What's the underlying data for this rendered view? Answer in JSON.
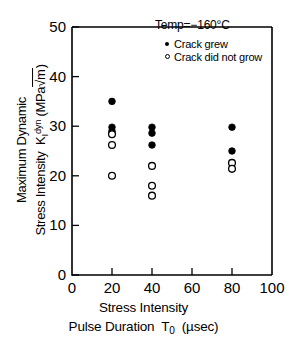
{
  "chart_data": {
    "type": "scatter",
    "title": "",
    "xlabel": "Stress Intensity Pulse Duration T0 (µsec)",
    "ylabel": "Maximum Dynamic Stress Intensity KIdyn (MPa√m)",
    "xlim": [
      0,
      100
    ],
    "ylim": [
      0,
      50
    ],
    "xticks": [
      0,
      20,
      40,
      60,
      80,
      100
    ],
    "yticks": [
      0,
      10,
      20,
      30,
      40,
      50
    ],
    "grid": false,
    "legend_position": "top-right",
    "annotation": "Temp=−160°C",
    "series": [
      {
        "name": "Crack grew",
        "marker": "filled-circle",
        "color": "#000000",
        "points": [
          {
            "x": 20,
            "y": 35.0
          },
          {
            "x": 20,
            "y": 29.8
          },
          {
            "x": 20,
            "y": 29.0
          },
          {
            "x": 40,
            "y": 29.8
          },
          {
            "x": 40,
            "y": 28.6
          },
          {
            "x": 40,
            "y": 26.2
          },
          {
            "x": 80,
            "y": 29.8
          },
          {
            "x": 80,
            "y": 25.0
          }
        ]
      },
      {
        "name": "Crack did not grow",
        "marker": "open-circle",
        "color": "#000000",
        "points": [
          {
            "x": 20,
            "y": 28.4
          },
          {
            "x": 20,
            "y": 26.2
          },
          {
            "x": 20,
            "y": 20.0
          },
          {
            "x": 40,
            "y": 22.0
          },
          {
            "x": 40,
            "y": 18.0
          },
          {
            "x": 40,
            "y": 16.0
          },
          {
            "x": 80,
            "y": 22.6
          },
          {
            "x": 80,
            "y": 21.4
          }
        ]
      }
    ]
  },
  "axes": {
    "x_tick_labels": [
      "0",
      "20",
      "40",
      "60",
      "80",
      "100"
    ],
    "y_tick_labels": [
      "0",
      "10",
      "20",
      "30",
      "40",
      "50"
    ],
    "ylabel_line1": "Maximum Dynamic",
    "ylabel_line2_prefix": "Stress Intensity",
    "ylabel_k": "K",
    "ylabel_k_sub": "I",
    "ylabel_k_sup": "dyn",
    "ylabel_units_open": "(MPa",
    "ylabel_units_radical": "√m",
    "ylabel_units_close": ")",
    "xlabel_line1": "Stress Intensity",
    "xlabel_line2_prefix": "Pulse Duration",
    "xlabel_t": "T",
    "xlabel_t_sub": "0",
    "xlabel_units": "(µsec)"
  },
  "annotation": {
    "temp": "Temp=−160°C"
  },
  "legend": {
    "entries": [
      {
        "label": "Crack grew",
        "marker": "filled-circle"
      },
      {
        "label": "Crack did not grow",
        "marker": "open-circle"
      }
    ]
  }
}
